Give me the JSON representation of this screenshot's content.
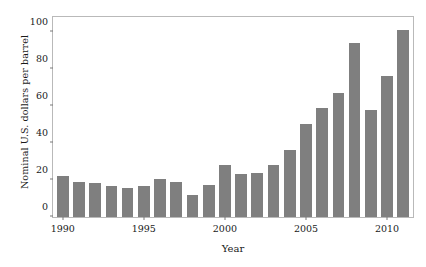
{
  "chart_data": {
    "type": "bar",
    "title": "",
    "subtitle": "",
    "xlabel": "Year",
    "ylabel": "Nominal U.S. dollars per barrel",
    "categories": [
      "1990",
      "1991",
      "1992",
      "1993",
      "1994",
      "1995",
      "1996",
      "1997",
      "1998",
      "1999",
      "2000",
      "2001",
      "2002",
      "2003",
      "2004",
      "2005",
      "2006",
      "2007",
      "2008",
      "2009",
      "2010",
      "2011"
    ],
    "values": [
      22,
      19,
      18.5,
      16.5,
      15.5,
      17,
      20.5,
      19,
      12,
      17.5,
      28,
      23,
      23.5,
      28,
      36,
      50,
      59,
      67,
      94,
      58,
      76,
      101
    ],
    "xlim": [
      1989.4,
      2011.6
    ],
    "ylim": [
      0,
      108
    ],
    "xticks": [
      "1990",
      "1995",
      "2000",
      "2005",
      "2010"
    ],
    "yticks": [
      "0",
      "20",
      "40",
      "60",
      "80",
      "100"
    ],
    "ytick_values": [
      0,
      20,
      40,
      60,
      80,
      100
    ],
    "xtick_values": [
      1990,
      1995,
      2000,
      2005,
      2010
    ],
    "grid": false,
    "legend": false,
    "legend_position": "none",
    "bar_color": "#7f7f7f",
    "frame_color": "#b9b9b9",
    "background_color": "#ffffff",
    "text_color": "#1a1a1a"
  }
}
